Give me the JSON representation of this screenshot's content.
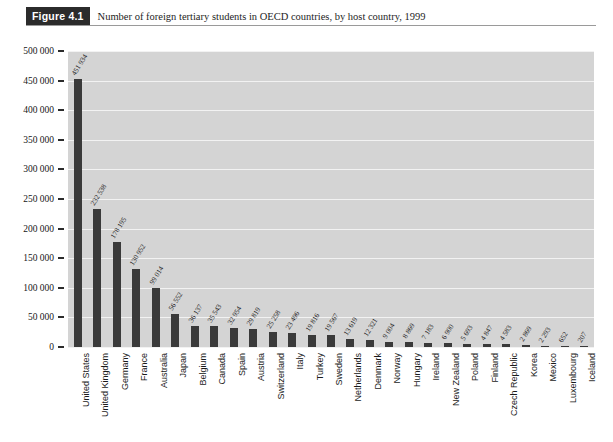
{
  "caption": {
    "figure_label": "Figure 4.1",
    "title": "Number of foreign tertiary students in OECD countries, by host country, 1999"
  },
  "colors": {
    "plot_background": "#d4d4d4",
    "gridline": "#f2f2f2",
    "bar": "#3a3a3a",
    "badge_background": "#2b2b2b",
    "badge_text": "#ffffff",
    "text": "#1a1a1a"
  },
  "chart_data": {
    "type": "bar",
    "title": "Number of foreign tertiary students in OECD countries, by host country, 1999",
    "xlabel": "",
    "ylabel": "",
    "ylim": [
      0,
      500000
    ],
    "ytick_step": 50000,
    "grid": true,
    "legend": "none",
    "orientation": "vertical",
    "ytick_labels": [
      "500 000",
      "450 000",
      "400 000",
      "350 000",
      "300 000",
      "250 000",
      "200 000",
      "150 000",
      "100 000",
      "50 000",
      "0"
    ],
    "ytick_values": [
      500000,
      450000,
      400000,
      350000,
      300000,
      250000,
      200000,
      150000,
      100000,
      50000,
      0
    ],
    "categories": [
      "United States",
      "United Kingdom",
      "Germany",
      "France",
      "Australia",
      "Japan",
      "Belgium",
      "Canada",
      "Spain",
      "Austria",
      "Switzerland",
      "Italy",
      "Turkey",
      "Sweden",
      "Netherlands",
      "Denmark",
      "Norway",
      "Hungary",
      "Ireland",
      "New Zealand",
      "Poland",
      "Finland",
      "Czech Republic",
      "Korea",
      "Mexico",
      "Luxembourg",
      "Iceland"
    ],
    "values": [
      451934,
      232538,
      178195,
      130952,
      99014,
      56552,
      36137,
      35543,
      32954,
      29819,
      25258,
      23496,
      19816,
      19567,
      13619,
      12321,
      9004,
      8869,
      7183,
      6900,
      5693,
      4847,
      4583,
      2869,
      2293,
      652,
      207
    ],
    "value_labels": [
      "451 934",
      "232 538",
      "178 195",
      "130 952",
      "99 014",
      "56 552",
      "36 137",
      "35 543",
      "32 954",
      "29 819",
      "25 258",
      "23 496",
      "19 816",
      "19 567",
      "13 619",
      "12 321",
      "9 004",
      "8 869",
      "7 183",
      "6 900",
      "5 693",
      "4 847",
      "4 583",
      "2 869",
      "2 293",
      "652",
      "207"
    ]
  }
}
